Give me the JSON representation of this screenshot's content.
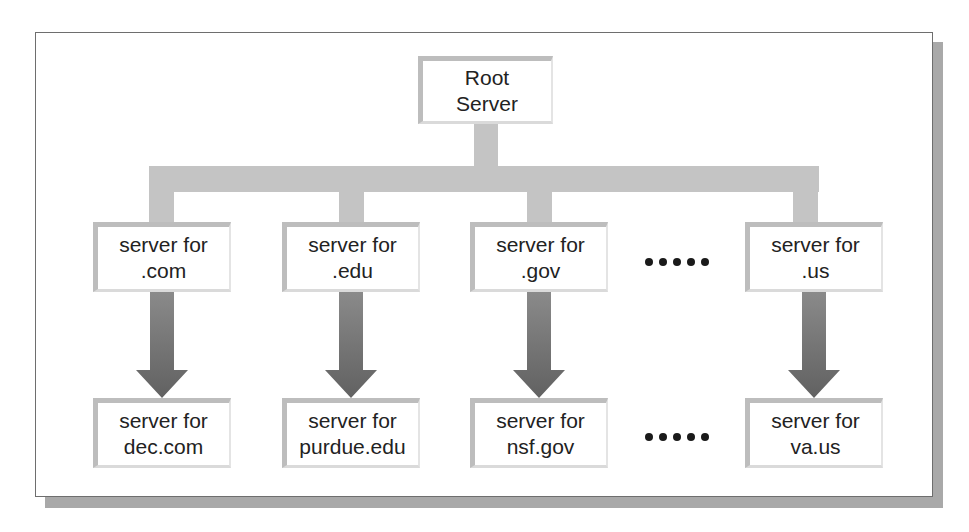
{
  "diagram": {
    "colors": {
      "connector": "#c4c4c4",
      "arrow": "#6f6f6f",
      "box_border": "#bdbdbd",
      "text": "#222222",
      "frame_shadow": "#a9a9a9"
    },
    "root": {
      "line1": "Root",
      "line2": "Server"
    },
    "level1": [
      {
        "line1": "server for",
        "line2": ".com"
      },
      {
        "line1": "server for",
        "line2": ".edu"
      },
      {
        "line1": "server for",
        "line2": ".gov"
      },
      {
        "line1": "server for",
        "line2": ".us"
      }
    ],
    "level2": [
      {
        "line1": "server for",
        "line2": "dec.com"
      },
      {
        "line1": "server for",
        "line2": "purdue.edu"
      },
      {
        "line1": "server for",
        "line2": "nsf.gov"
      },
      {
        "line1": "server for",
        "line2": "va.us"
      }
    ],
    "ellipsis": {
      "level1_dots": 5,
      "level2_dots": 5
    },
    "edges": [
      {
        "from": "Root Server",
        "to": "server for .com",
        "style": "connector"
      },
      {
        "from": "Root Server",
        "to": "server for .edu",
        "style": "connector"
      },
      {
        "from": "Root Server",
        "to": "server for .gov",
        "style": "connector"
      },
      {
        "from": "Root Server",
        "to": "server for .us",
        "style": "connector"
      },
      {
        "from": "server for .com",
        "to": "server for dec.com",
        "style": "arrow"
      },
      {
        "from": "server for .edu",
        "to": "server for purdue.edu",
        "style": "arrow"
      },
      {
        "from": "server for .gov",
        "to": "server for nsf.gov",
        "style": "arrow"
      },
      {
        "from": "server for .us",
        "to": "server for va.us",
        "style": "arrow"
      }
    ]
  }
}
